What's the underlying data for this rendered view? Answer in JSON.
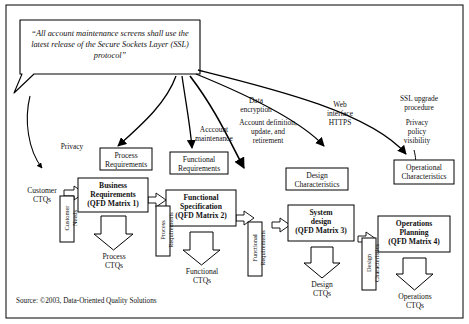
{
  "callout": {
    "text": "“All account maintenance screens shall use the latest release of the Secure Sockets Layer (SSL) protocol”"
  },
  "annotations": [
    {
      "id": "privacy",
      "text": "Privacy"
    },
    {
      "id": "account-maintenance",
      "text": "Acccount\nmaintenance"
    },
    {
      "id": "data-encryption",
      "text": "Data\nencryption"
    },
    {
      "id": "account-definition",
      "text": "Account definition,\nupdate, and\nretirement"
    },
    {
      "id": "web-interface",
      "text": "Web\ninterface\nHTTPS"
    },
    {
      "id": "ssl-upgrade",
      "text": "SSL upgrade\nprocedure"
    },
    {
      "id": "privacy-policy-visibility",
      "text": "Privacy\npolicy\nvisibility"
    }
  ],
  "nodes": {
    "customer_ctqs": "Customer\nCTQs",
    "customer_needs": "Customer\nNeeds",
    "process_requirements_top": "Process\nRequirements",
    "business_requirements": "Business\nRequirements\n(QFD Matrix 1)",
    "process_requirements_vert": "Process\nRequirements",
    "functional_requirements_top": "Functional\nRequirements",
    "functional_specification": "Functional\nSpecification\n(QFD Matrix 2)",
    "functional_requirements_vert": "Functional\nRequirements",
    "design_characteristics_top": "Design\nCharacteristics",
    "system_design": "System\ndesign\n(QFD Matrix 3)",
    "design_characteristics_vert": "Design\nCharacteristics",
    "operational_characteristics_top": "Operational\nCharacteristics",
    "operations_planning": "Operations\nPlanning\n(QFD Matrix 4)",
    "process_ctqs": "Process\nCTQs",
    "functional_ctqs": "Functional\nCTQs",
    "design_ctqs": "Design\nCTQs",
    "operations_ctqs": "Operations\nCTQs"
  },
  "source": "Source: ©2003, Data-Oriented Quality Solutions",
  "colors": {
    "stroke": "#000000",
    "fill": "#ffffff",
    "text": "#111111"
  }
}
